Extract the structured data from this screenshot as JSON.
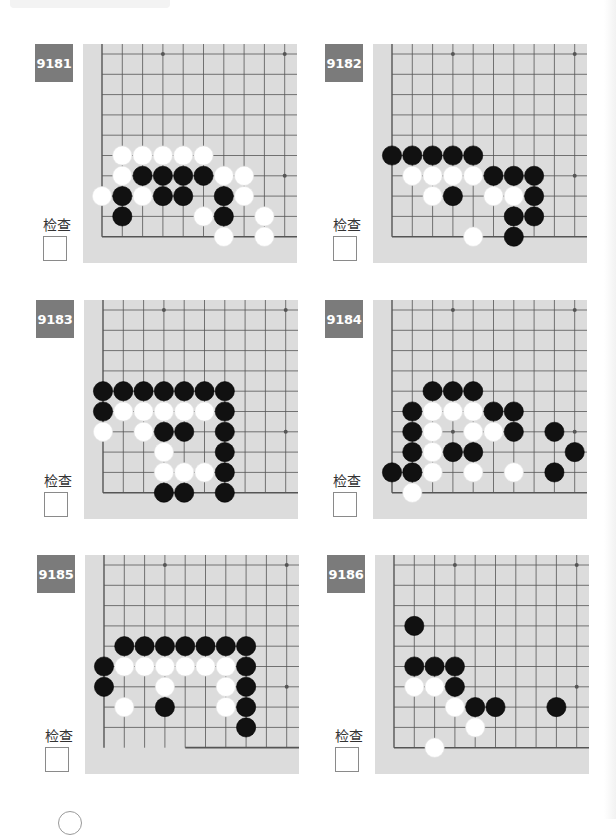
{
  "page": {
    "check_label": "检查",
    "colors": {
      "board_bg": "#dcdcdc",
      "grid_line": "#555555",
      "label_bg": "#7b7b7b",
      "label_text": "#ffffff",
      "black_stone": "#111111",
      "white_stone": "#ffffff"
    }
  },
  "problems": [
    {
      "id": "9181",
      "label": "9181",
      "check_label": "检查",
      "edges": "left-bottom",
      "stones": {
        "black": [
          [
            2,
            6
          ],
          [
            3,
            6
          ],
          [
            4,
            6
          ],
          [
            5,
            6
          ],
          [
            1,
            7
          ],
          [
            3,
            7
          ],
          [
            4,
            7
          ],
          [
            6,
            7
          ],
          [
            1,
            8
          ],
          [
            6,
            8
          ]
        ],
        "white": [
          [
            1,
            5
          ],
          [
            2,
            5
          ],
          [
            3,
            5
          ],
          [
            4,
            5
          ],
          [
            5,
            5
          ],
          [
            1,
            6
          ],
          [
            6,
            6
          ],
          [
            7,
            6
          ],
          [
            0,
            7
          ],
          [
            2,
            7
          ],
          [
            7,
            7
          ],
          [
            5,
            8
          ],
          [
            8,
            8
          ],
          [
            6,
            9
          ],
          [
            8,
            9
          ]
        ]
      }
    },
    {
      "id": "9182",
      "label": "9182",
      "check_label": "检查",
      "edges": "left-bottom",
      "stones": {
        "black": [
          [
            0,
            5
          ],
          [
            1,
            5
          ],
          [
            2,
            5
          ],
          [
            3,
            5
          ],
          [
            4,
            5
          ],
          [
            5,
            6
          ],
          [
            6,
            6
          ],
          [
            7,
            6
          ],
          [
            3,
            7
          ],
          [
            7,
            7
          ],
          [
            6,
            8
          ],
          [
            7,
            8
          ],
          [
            6,
            9
          ]
        ],
        "white": [
          [
            1,
            6
          ],
          [
            2,
            6
          ],
          [
            3,
            6
          ],
          [
            4,
            6
          ],
          [
            2,
            7
          ],
          [
            5,
            7
          ],
          [
            6,
            7
          ],
          [
            4,
            9
          ]
        ]
      }
    },
    {
      "id": "9183",
      "label": "9183",
      "check_label": "检查",
      "edges": "left-bottom",
      "stones": {
        "black": [
          [
            0,
            4
          ],
          [
            1,
            4
          ],
          [
            2,
            4
          ],
          [
            3,
            4
          ],
          [
            4,
            4
          ],
          [
            5,
            4
          ],
          [
            6,
            4
          ],
          [
            0,
            5
          ],
          [
            6,
            5
          ],
          [
            3,
            6
          ],
          [
            4,
            6
          ],
          [
            6,
            6
          ],
          [
            6,
            7
          ],
          [
            6,
            8
          ],
          [
            3,
            9
          ],
          [
            4,
            9
          ],
          [
            6,
            9
          ]
        ],
        "white": [
          [
            1,
            5
          ],
          [
            2,
            5
          ],
          [
            3,
            5
          ],
          [
            4,
            5
          ],
          [
            5,
            5
          ],
          [
            0,
            6
          ],
          [
            2,
            6
          ],
          [
            3,
            7
          ],
          [
            3,
            8
          ],
          [
            4,
            8
          ],
          [
            5,
            8
          ]
        ]
      }
    },
    {
      "id": "9184",
      "label": "9184",
      "check_label": "检查",
      "edges": "left-bottom",
      "stones": {
        "black": [
          [
            2,
            4
          ],
          [
            3,
            4
          ],
          [
            4,
            4
          ],
          [
            1,
            5
          ],
          [
            5,
            5
          ],
          [
            6,
            5
          ],
          [
            1,
            6
          ],
          [
            6,
            6
          ],
          [
            8,
            6
          ],
          [
            1,
            7
          ],
          [
            3,
            7
          ],
          [
            4,
            7
          ],
          [
            9,
            7
          ],
          [
            0,
            8
          ],
          [
            1,
            8
          ],
          [
            8,
            8
          ]
        ],
        "white": [
          [
            2,
            5
          ],
          [
            3,
            5
          ],
          [
            4,
            5
          ],
          [
            2,
            6
          ],
          [
            4,
            6
          ],
          [
            5,
            6
          ],
          [
            2,
            7
          ],
          [
            2,
            8
          ],
          [
            4,
            8
          ],
          [
            6,
            8
          ],
          [
            1,
            9
          ]
        ]
      }
    },
    {
      "id": "9185",
      "label": "9185",
      "check_label": "检查",
      "edges": "left-bottom-partial",
      "stones": {
        "black": [
          [
            1,
            4
          ],
          [
            2,
            4
          ],
          [
            3,
            4
          ],
          [
            4,
            4
          ],
          [
            5,
            4
          ],
          [
            6,
            4
          ],
          [
            7,
            4
          ],
          [
            0,
            5
          ],
          [
            7,
            5
          ],
          [
            0,
            6
          ],
          [
            7,
            6
          ],
          [
            3,
            7
          ],
          [
            7,
            7
          ],
          [
            7,
            8
          ]
        ],
        "white": [
          [
            1,
            5
          ],
          [
            2,
            5
          ],
          [
            3,
            5
          ],
          [
            4,
            5
          ],
          [
            5,
            5
          ],
          [
            6,
            5
          ],
          [
            3,
            6
          ],
          [
            6,
            6
          ],
          [
            1,
            7
          ],
          [
            6,
            7
          ]
        ]
      }
    },
    {
      "id": "9186",
      "label": "9186",
      "check_label": "检查",
      "edges": "left-bottom",
      "stones": {
        "black": [
          [
            1,
            3
          ],
          [
            1,
            5
          ],
          [
            2,
            5
          ],
          [
            3,
            5
          ],
          [
            3,
            6
          ],
          [
            4,
            7
          ],
          [
            5,
            7
          ],
          [
            8,
            7
          ]
        ],
        "white": [
          [
            1,
            6
          ],
          [
            2,
            6
          ],
          [
            3,
            7
          ],
          [
            4,
            8
          ],
          [
            2,
            9
          ]
        ]
      }
    }
  ]
}
